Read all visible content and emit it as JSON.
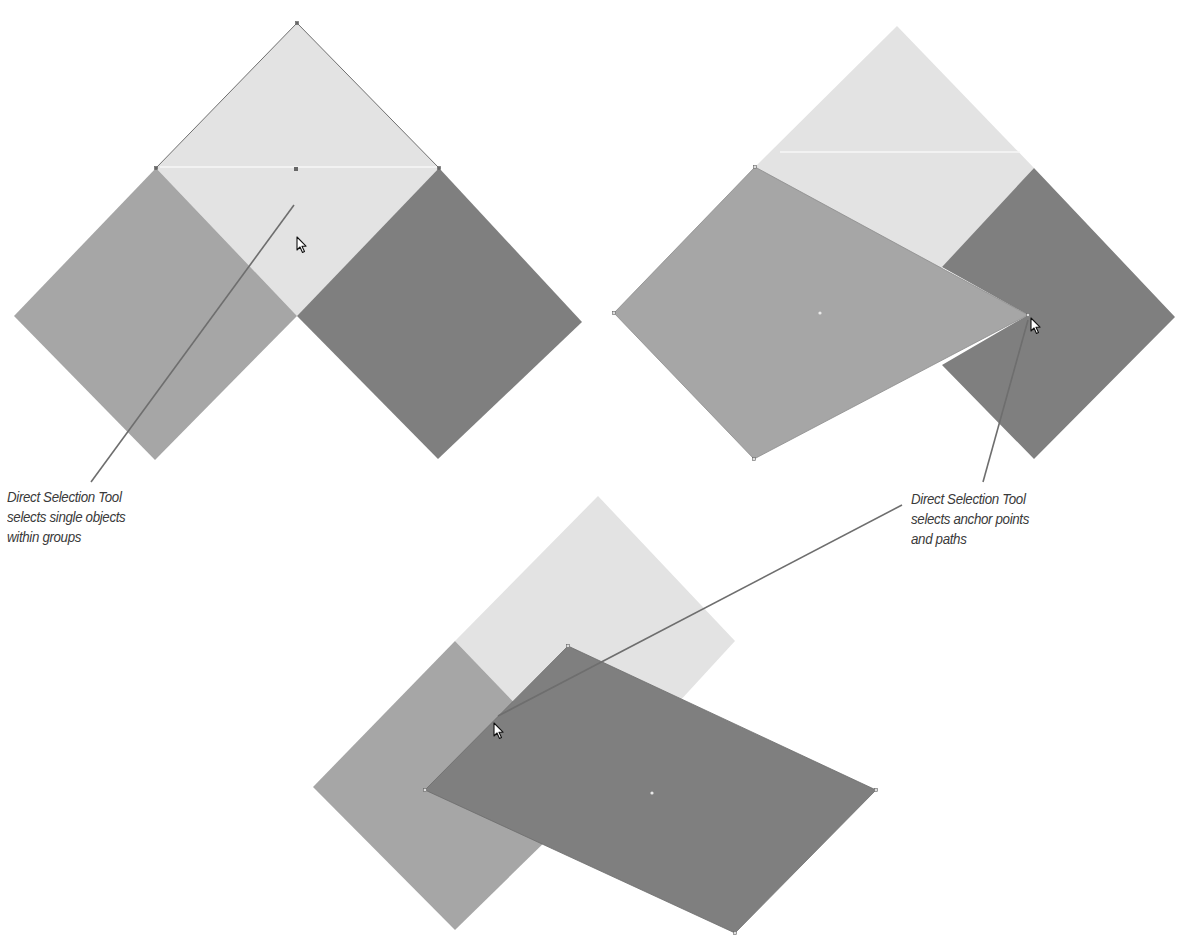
{
  "colors": {
    "light": "#e3e3e3",
    "medium": "#a6a6a6",
    "dark": "#7f7f7f",
    "stroke": "#777777",
    "leader": "#6e6e6e",
    "text": "#3a3a3a"
  },
  "figures": [
    {
      "id": "figure-group-selected",
      "description": "Three diamond squares grouped; Direct Selection Tool selects a single object within the group",
      "shapes": {
        "light": [
          [
            297,
            23
          ],
          [
            439,
            168
          ],
          [
            297,
            316
          ],
          [
            156,
            168
          ]
        ],
        "medium": [
          [
            156,
            168
          ],
          [
            297,
            316
          ],
          [
            155,
            460
          ],
          [
            14,
            316
          ]
        ],
        "dark": [
          [
            439,
            168
          ],
          [
            582,
            322
          ],
          [
            438,
            459
          ],
          [
            297,
            316
          ]
        ]
      },
      "highlight_line": [
        [
          160,
          167
        ],
        [
          437,
          167
        ]
      ],
      "center_dot": [
        296,
        169
      ],
      "cursor": [
        297,
        237
      ]
    },
    {
      "id": "figure-anchor-dragged",
      "description": "Anchor point of the medium shape dragged to the right",
      "shapes": {
        "light": [
          [
            897,
            26
          ],
          [
            1034,
            168
          ],
          [
            897,
            316
          ],
          [
            755,
            167
          ]
        ],
        "dark": [
          [
            1034,
            168
          ],
          [
            1175,
            317
          ],
          [
            1034,
            459
          ],
          [
            942,
            365
          ],
          [
            1028,
            315
          ],
          [
            942,
            267
          ]
        ],
        "medium": [
          [
            755,
            167
          ],
          [
            1028,
            315
          ],
          [
            754,
            459
          ],
          [
            614,
            313
          ]
        ]
      },
      "highlight_line": [
        [
          780,
          152
        ],
        [
          1020,
          152
        ]
      ],
      "center_dot": [
        820,
        313
      ],
      "cursor": [
        1031,
        318
      ]
    },
    {
      "id": "figure-path-moved",
      "description": "Dark shape path selected and moved",
      "shapes": {
        "light": [
          [
            598,
            496
          ],
          [
            735,
            641
          ],
          [
            598,
            790
          ],
          [
            455,
            641
          ]
        ],
        "medium": [
          [
            455,
            641
          ],
          [
            598,
            790
          ],
          [
            455,
            930
          ],
          [
            313,
            787
          ]
        ],
        "dark": [
          [
            568,
            646
          ],
          [
            876,
            790
          ],
          [
            735,
            933
          ],
          [
            425,
            790
          ]
        ]
      },
      "center_dot": [
        652,
        793
      ],
      "cursor": [
        494,
        723
      ]
    }
  ],
  "captions": [
    {
      "id": "caption-group",
      "lines": [
        "Direct Selection Tool",
        "selects single objects",
        "within groups"
      ],
      "position": [
        7,
        487
      ],
      "leader": [
        [
          294,
          205
        ],
        [
          91,
          482
        ]
      ]
    },
    {
      "id": "caption-anchor",
      "lines": [
        "Direct Selection Tool",
        "selects anchor points",
        "and paths"
      ],
      "position": [
        911,
        489
      ],
      "leaders": [
        [
          [
            1028,
            320
          ],
          [
            983,
            482
          ]
        ],
        [
          [
            498,
            716
          ],
          [
            902,
            505
          ]
        ]
      ]
    }
  ]
}
